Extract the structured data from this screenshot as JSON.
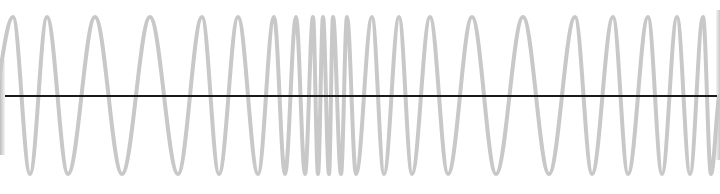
{
  "figure": {
    "wave_color": "#c8c8c8",
    "axis_color": "#1a1a1a",
    "background": "#ffffff"
  },
  "wave": {
    "top_y": 17,
    "bottom_y": 174,
    "peaks_x": [
      13,
      47,
      95,
      150,
      202,
      238,
      274,
      296,
      313,
      323,
      333,
      347,
      372,
      399,
      430,
      472,
      523,
      575,
      613,
      648,
      677,
      703
    ],
    "troughs_x": [
      30,
      68,
      122,
      178,
      219,
      258,
      285,
      305,
      318,
      329,
      341,
      356,
      384,
      412,
      448,
      496,
      549,
      592,
      628,
      662,
      690,
      711
    ]
  },
  "axis": {
    "y": 96,
    "x_start": 5,
    "x_end": 717
  }
}
